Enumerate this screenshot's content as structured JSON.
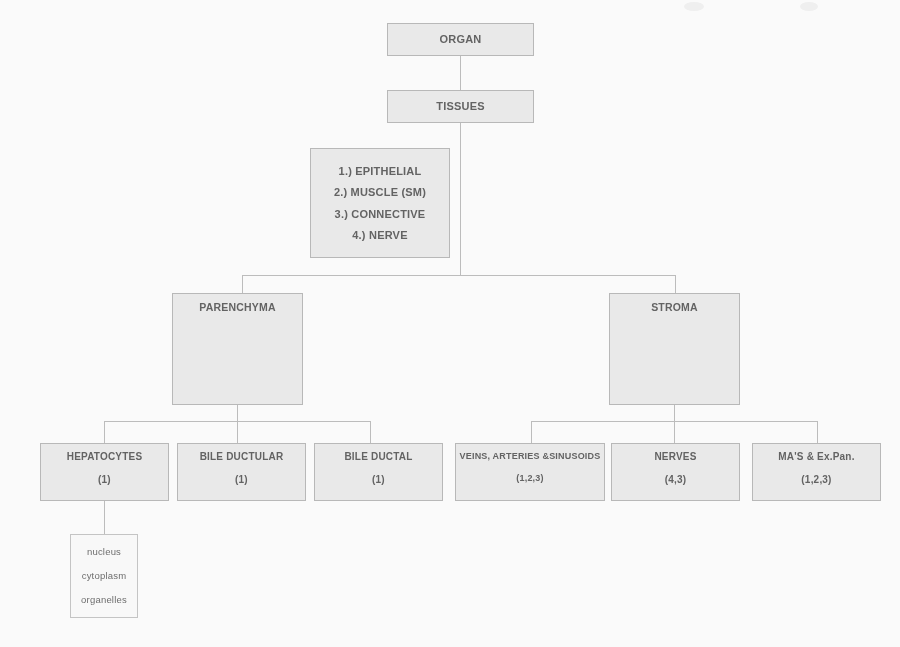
{
  "diagram": {
    "colors": {
      "box_fill": "#ededed",
      "box_border": "#b9b9b9",
      "plain_fill": "#fdfdfd",
      "text": "#5e5e5e",
      "connector": "#bdbdbd"
    },
    "nodes": {
      "organ": {
        "label": "ORGAN"
      },
      "tissues": {
        "label": "TISSUES"
      },
      "tissue_types": {
        "items": [
          "1.) EPITHELIAL",
          "2.) MUSCLE (SM)",
          "3.) CONNECTIVE",
          "4.) NERVE"
        ]
      },
      "parenchyma": {
        "label": "PARENCHYMA"
      },
      "stroma": {
        "label": "STROMA"
      },
      "hepatocytes": {
        "label": "HEPATOCYTES",
        "code": "(1)"
      },
      "bile_ductular": {
        "label": "BILE DUCTULAR",
        "code": "(1)"
      },
      "bile_ductal": {
        "label": "BILE DUCTAL",
        "code": "(1)"
      },
      "vessels": {
        "label": "VEINS, ARTERIES &SINUSOIDS",
        "code": "(1,2,3)"
      },
      "nerves": {
        "label": "NERVES",
        "code": "(4,3)"
      },
      "mas_expan": {
        "label": "MA'S & Ex.Pan.",
        "code": "(1,2,3)"
      },
      "cell_parts": {
        "items": [
          "nucleus",
          "cytoplasm",
          "organelles"
        ]
      }
    }
  }
}
